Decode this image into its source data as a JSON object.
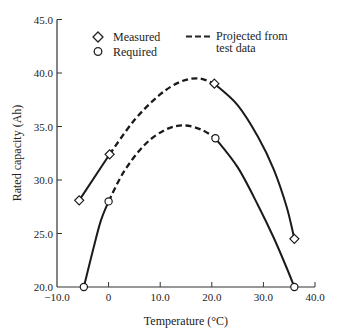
{
  "chart_data": {
    "type": "line",
    "title": "",
    "xlabel": "Temperature (°C)",
    "ylabel": "Rated capacity (Ah)",
    "xlim": [
      -10,
      40
    ],
    "ylim": [
      20,
      45
    ],
    "x_ticks": [
      -10,
      0,
      10,
      20,
      30,
      40
    ],
    "x_tick_labels": [
      "−10.0",
      "0",
      "10.0",
      "20.0",
      "30.0",
      "40.0"
    ],
    "y_ticks": [
      20,
      25,
      30,
      35,
      40,
      45
    ],
    "y_tick_labels": [
      "20.0",
      "25.0",
      "30.0",
      "35.0",
      "40.0",
      "45.0"
    ],
    "grid": false,
    "legend": {
      "position": "top",
      "entries": [
        {
          "label": "Measured",
          "marker": "diamond"
        },
        {
          "label": "Required",
          "marker": "circle"
        },
        {
          "label": "Projected from\ntest data",
          "line": "dashed"
        }
      ]
    },
    "series": [
      {
        "name": "Measured",
        "marker": "diamond",
        "points": [
          {
            "x": -5.7,
            "y": 28.1
          },
          {
            "x": 0.2,
            "y": 32.4
          },
          {
            "x": 20.5,
            "y": 39.0
          },
          {
            "x": 36.0,
            "y": 24.5
          }
        ],
        "projected_peak": {
          "x": 17.5,
          "y": 39.5
        },
        "segments": [
          {
            "style": "solid",
            "path": [
              [
                -5.7,
                28.1
              ],
              [
                0.2,
                32.4
              ]
            ]
          },
          {
            "style": "dashed",
            "path": [
              [
                0.2,
                32.4
              ],
              [
                5,
                35.6
              ],
              [
                10,
                38.0
              ],
              [
                14,
                39.2
              ],
              [
                17.5,
                39.5
              ],
              [
                20.5,
                39.0
              ]
            ]
          },
          {
            "style": "solid",
            "path": [
              [
                20.5,
                39.0
              ],
              [
                25,
                37.0
              ],
              [
                29,
                34.0
              ],
              [
                32,
                31.0
              ],
              [
                34.5,
                27.5
              ],
              [
                36.0,
                24.5
              ]
            ]
          }
        ]
      },
      {
        "name": "Required",
        "marker": "circle",
        "points": [
          {
            "x": -4.8,
            "y": 20.0
          },
          {
            "x": 0.0,
            "y": 28.0
          },
          {
            "x": 20.7,
            "y": 33.9
          },
          {
            "x": 36.0,
            "y": 20.0
          }
        ],
        "projected_peak": {
          "x": 14.5,
          "y": 35.1
        },
        "segments": [
          {
            "style": "solid",
            "path": [
              [
                -4.8,
                20.0
              ],
              [
                -3,
                23.5
              ],
              [
                -1.5,
                26.2
              ],
              [
                0.0,
                28.0
              ]
            ]
          },
          {
            "style": "dashed",
            "path": [
              [
                0.0,
                28.0
              ],
              [
                3,
                30.8
              ],
              [
                7,
                33.3
              ],
              [
                11,
                34.7
              ],
              [
                14.5,
                35.1
              ],
              [
                18,
                34.7
              ],
              [
                20.7,
                33.9
              ]
            ]
          },
          {
            "style": "solid",
            "path": [
              [
                20.7,
                33.9
              ],
              [
                25,
                31.2
              ],
              [
                29,
                27.6
              ],
              [
                32,
                24.6
              ],
              [
                34.5,
                21.8
              ],
              [
                36.0,
                20.0
              ]
            ]
          }
        ]
      }
    ]
  },
  "legend_labels": {
    "measured": "Measured",
    "required": "Required",
    "projected_line1": "Projected from",
    "projected_line2": "test data"
  },
  "axes": {
    "xlabel": "Temperature (°C)",
    "ylabel": "Rated capacity (Ah)"
  }
}
